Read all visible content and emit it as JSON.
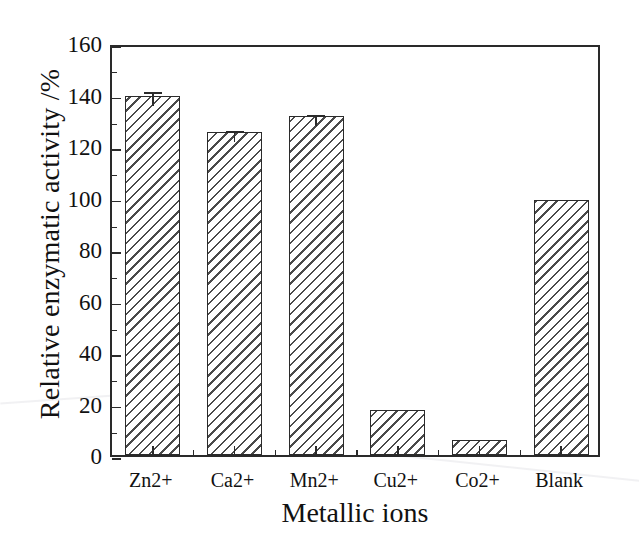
{
  "chart_data": {
    "type": "bar",
    "title": "",
    "xlabel": "Metallic ions",
    "ylabel": "Relative enzymatic activity /%",
    "categories": [
      "Zn2+",
      "Ca2+",
      "Mn2+",
      "Cu2+",
      "Co2+",
      "Blank"
    ],
    "values": [
      139.5,
      125.5,
      131.5,
      17.5,
      6.0,
      99.0
    ],
    "errors": [
      3.0,
      1.8,
      2.2,
      0.0,
      0.0,
      0.0
    ],
    "ylim": [
      0,
      160
    ],
    "yticks": [
      0,
      20,
      40,
      60,
      80,
      100,
      120,
      140,
      160
    ],
    "ytick_labels": [
      "0",
      "20",
      "40",
      "60",
      "80",
      "100",
      "120",
      "140",
      "160"
    ],
    "minor_ticks": true,
    "grid": false,
    "legend": null,
    "bar_fill": "white-with-diagonal-hatch",
    "bar_edge_color": "#2b2b2b"
  },
  "axes": {
    "y_axis_title": "Relative enzymatic activity /%",
    "x_axis_title": "Metallic ions",
    "y_min_label": "0",
    "y_max_label": "160"
  }
}
